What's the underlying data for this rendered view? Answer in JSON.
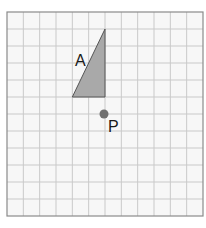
{
  "diagram": {
    "type": "grid-transformation",
    "grid": {
      "columns": 12,
      "rows": 12,
      "origin_px": [
        7,
        12
      ],
      "cell_px": 16.33,
      "line_color": "#c9c9c9",
      "border_color": "#8a8a8a",
      "background": "#f7f7f7"
    },
    "shapes": [
      {
        "name": "A",
        "label": "A",
        "kind": "right-triangle",
        "vertices_grid": [
          [
            6,
            1
          ],
          [
            4,
            5
          ],
          [
            6,
            5
          ]
        ],
        "fill": "#a9a9a9",
        "stroke": "#555555"
      }
    ],
    "points": [
      {
        "name": "P",
        "label": "P",
        "position_grid": [
          6,
          6
        ],
        "color": "#707070"
      }
    ]
  }
}
